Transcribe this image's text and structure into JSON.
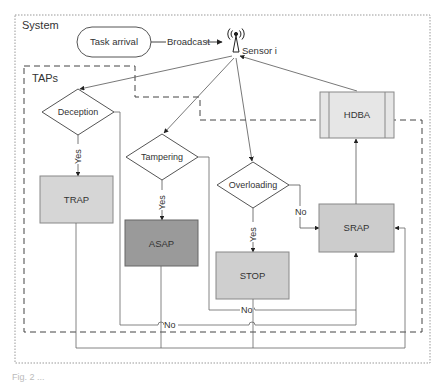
{
  "diagram": {
    "system_label": "System",
    "taps_label": "TAPs",
    "task_arrival": "Task arrival",
    "broadcast": "Broadcast",
    "sensor": "Sensor i",
    "icon_sensor": "antenna-tower-icon",
    "decisions": [
      {
        "id": "deception",
        "label": "Deception",
        "yes": "Yes"
      },
      {
        "id": "tampering",
        "label": "Tampering",
        "yes": "Yes"
      },
      {
        "id": "overloading",
        "label": "Overloading",
        "yes": "Yes",
        "no": "No"
      }
    ],
    "processes": [
      {
        "id": "trap",
        "label": "TRAP",
        "fill": "#d6d6d6"
      },
      {
        "id": "asap",
        "label": "ASAP",
        "fill": "#9a9a9a"
      },
      {
        "id": "stop",
        "label": "STOP",
        "fill": "#cfcfcf"
      },
      {
        "id": "srap",
        "label": "SRAP",
        "fill": "#cccccc"
      },
      {
        "id": "hdba",
        "label": "HDBA",
        "fill": "#e6e6e6"
      }
    ],
    "no_labels": [
      "No",
      "No"
    ],
    "colors": {
      "line": "#666666",
      "border": "#777777",
      "text": "#333333"
    }
  },
  "caption": "Fig. 2 ..."
}
